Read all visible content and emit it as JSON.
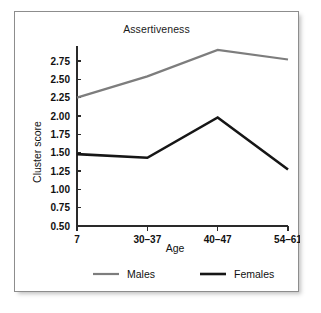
{
  "figure": {
    "frame_border_color": "#8d8d8d",
    "background_color": "#ffffff"
  },
  "chart_data": {
    "type": "line",
    "title": "Assertiveness",
    "xlabel": "Age",
    "ylabel": "Cluster score",
    "categories": [
      "7",
      "30–37",
      "40–47",
      "54–61"
    ],
    "ylim": [
      0.5,
      2.9
    ],
    "yticks": [
      "0.50",
      "0.75",
      "1.00",
      "1.25",
      "1.50",
      "1.75",
      "2.00",
      "2.25",
      "2.50",
      "2.75"
    ],
    "ytick_values": [
      0.5,
      0.75,
      1.0,
      1.25,
      1.5,
      1.75,
      2.0,
      2.25,
      2.5,
      2.75
    ],
    "grid": false,
    "legend_position": "bottom",
    "series": [
      {
        "name": "Males",
        "color": "#7d7d7d",
        "width": 2.2,
        "values": [
          2.25,
          2.54,
          2.9,
          2.77
        ]
      },
      {
        "name": "Females",
        "color": "#161616",
        "width": 2.6,
        "values": [
          1.48,
          1.43,
          1.98,
          1.27
        ]
      }
    ]
  }
}
